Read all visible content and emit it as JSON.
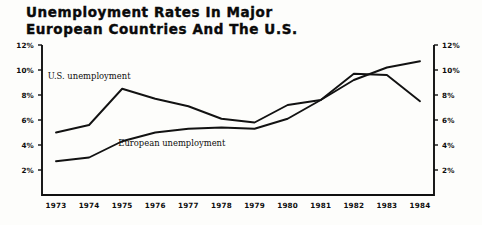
{
  "figure": {
    "title_lines": [
      "Unemployment Rates In Major",
      "European Countries And The U.S."
    ]
  },
  "chart_data": {
    "type": "line",
    "title": "Unemployment Rates In Major European Countries And The U.S.",
    "subtitle": "",
    "xlabel": "",
    "ylabel": "",
    "x": [
      1973,
      1974,
      1975,
      1976,
      1977,
      1978,
      1979,
      1980,
      1981,
      1982,
      1983,
      1984
    ],
    "categories": [
      "1973",
      "1974",
      "1975",
      "1976",
      "1977",
      "1978",
      "1979",
      "1980",
      "1981",
      "1982",
      "1983",
      "1984"
    ],
    "ylim": [
      0,
      12
    ],
    "yticks": [
      2,
      4,
      6,
      8,
      10,
      12
    ],
    "ytick_labels": [
      "2%",
      "4%",
      "6%",
      "8%",
      "10%",
      "12%"
    ],
    "ytick_labels_right": [
      "2%",
      "4%",
      "6%",
      "8%",
      "10%",
      "12%"
    ],
    "grid": false,
    "legend": "inline-annotations",
    "series": [
      {
        "name": "U.S. unemployment",
        "label_position": "upper-left",
        "values": [
          5.0,
          5.6,
          8.5,
          7.7,
          7.1,
          6.1,
          5.8,
          7.2,
          7.6,
          9.7,
          9.6,
          7.5
        ]
      },
      {
        "name": "European unemployment",
        "label_position": "lower-center",
        "values": [
          2.7,
          3.0,
          4.3,
          5.0,
          5.3,
          5.4,
          5.3,
          6.1,
          7.6,
          9.2,
          10.2,
          10.7
        ]
      }
    ],
    "annotations": [
      {
        "text": "U.S. unemployment",
        "x": 1974.0,
        "y": 9.3
      },
      {
        "text": "European unemployment",
        "x": 1976.5,
        "y": 3.9
      }
    ]
  },
  "colors": {
    "line": "#121212",
    "frame": "#101010",
    "text": "#0d0d0d",
    "background": "#fdfdfb"
  }
}
